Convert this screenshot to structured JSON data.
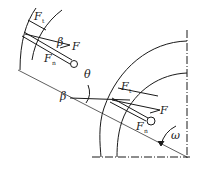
{
  "diagram": {
    "type": "force diagram of rotating rod/pendulum in circular housing",
    "colors": {
      "line": "#1a1a1a",
      "background": "#ffffff"
    },
    "labels": {
      "top": {
        "F_t": "F",
        "F_t_sub": "t",
        "F": "F",
        "F_n": "F",
        "F_n_sub": "n",
        "beta": "β"
      },
      "middle": {
        "theta": "θ",
        "beta": "β"
      },
      "bottom": {
        "F_t": "F",
        "F_t_sub": "t",
        "F": "F",
        "F_n": "F",
        "F_n_sub": "n",
        "omega": "ω"
      }
    }
  }
}
